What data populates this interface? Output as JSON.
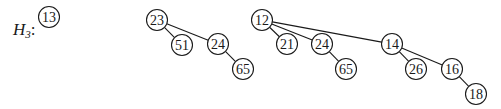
{
  "label": {
    "name": "H",
    "subscript": "3",
    "suffix": ":"
  },
  "style": {
    "stroke": "#1a1a1a",
    "fill": "#ffffff",
    "node_radius": 10.5
  },
  "trees": [
    {
      "id": "tree-13",
      "nodes": [
        {
          "id": "n13",
          "value": "13",
          "x": 49,
          "y": 17
        }
      ],
      "edges": []
    },
    {
      "id": "tree-23",
      "nodes": [
        {
          "id": "n23",
          "value": "23",
          "x": 157,
          "y": 20
        },
        {
          "id": "n51",
          "value": "51",
          "x": 182,
          "y": 45
        },
        {
          "id": "n24a",
          "value": "24",
          "x": 218,
          "y": 44
        },
        {
          "id": "n65a",
          "value": "65",
          "x": 243,
          "y": 69
        }
      ],
      "edges": [
        [
          "n23",
          "n51"
        ],
        [
          "n23",
          "n24a"
        ],
        [
          "n24a",
          "n65a"
        ]
      ]
    },
    {
      "id": "tree-12",
      "nodes": [
        {
          "id": "n12",
          "value": "12",
          "x": 262,
          "y": 20
        },
        {
          "id": "n21",
          "value": "21",
          "x": 287,
          "y": 44
        },
        {
          "id": "n24b",
          "value": "24",
          "x": 322,
          "y": 44
        },
        {
          "id": "n65b",
          "value": "65",
          "x": 346,
          "y": 69
        },
        {
          "id": "n14",
          "value": "14",
          "x": 392,
          "y": 44
        },
        {
          "id": "n26",
          "value": "26",
          "x": 416,
          "y": 69
        },
        {
          "id": "n16",
          "value": "16",
          "x": 452,
          "y": 69
        },
        {
          "id": "n18",
          "value": "18",
          "x": 476,
          "y": 94
        }
      ],
      "edges": [
        [
          "n12",
          "n21"
        ],
        [
          "n12",
          "n24b"
        ],
        [
          "n12",
          "n14"
        ],
        [
          "n24b",
          "n65b"
        ],
        [
          "n14",
          "n26"
        ],
        [
          "n14",
          "n16"
        ],
        [
          "n16",
          "n18"
        ]
      ]
    }
  ]
}
